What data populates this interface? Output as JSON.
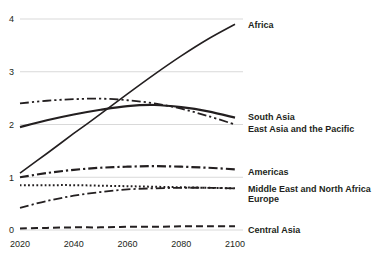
{
  "chart_data": {
    "type": "line",
    "title": "",
    "subtitle": "",
    "xlabel": "",
    "ylabel": "",
    "xlim": [
      2020,
      2100
    ],
    "ylim": [
      0,
      4
    ],
    "xticks": [
      2020,
      2040,
      2060,
      2080,
      2100
    ],
    "xtick_labels": [
      "2020",
      "2040",
      "2060",
      "2080",
      "2100"
    ],
    "yticks": [
      0,
      1,
      2,
      3,
      4
    ],
    "ytick_labels": [
      "0",
      "1",
      "2",
      "3",
      "4"
    ],
    "grid": "horizontal",
    "legend_position": "right-inline-end-of-line",
    "x": [
      2020,
      2030,
      2040,
      2050,
      2060,
      2070,
      2080,
      2090,
      2100
    ],
    "series": [
      {
        "name": "Africa",
        "label": "Africa",
        "style": "solid",
        "width": 1.6,
        "values": [
          1.08,
          1.45,
          1.83,
          2.2,
          2.58,
          2.95,
          3.3,
          3.62,
          3.9
        ],
        "label_y": 3.9
      },
      {
        "name": "South Asia",
        "label": "South Asia",
        "style": "solid",
        "width": 2.2,
        "values": [
          1.95,
          2.08,
          2.19,
          2.28,
          2.35,
          2.37,
          2.33,
          2.25,
          2.13
        ],
        "label_y": 2.25
      },
      {
        "name": "East Asia and the Pacific",
        "label": "East Asia and the Pacific",
        "style": "dash-dot-dot",
        "width": 1.8,
        "values": [
          2.4,
          2.45,
          2.48,
          2.49,
          2.46,
          2.4,
          2.3,
          2.16,
          2.0
        ],
        "label_y": 2.0
      },
      {
        "name": "Americas",
        "label": "Americas",
        "style": "dash-dot",
        "width": 2.2,
        "values": [
          1.0,
          1.08,
          1.14,
          1.18,
          1.2,
          1.21,
          1.2,
          1.18,
          1.15
        ],
        "label_y": 1.15
      },
      {
        "name": "Middle East and North Africa",
        "label": "Middle East and North Africa",
        "style": "dotted",
        "width": 2.0,
        "values": [
          0.85,
          0.85,
          0.85,
          0.84,
          0.83,
          0.82,
          0.81,
          0.8,
          0.79
        ],
        "label_y": 0.83
      },
      {
        "name": "Europe",
        "label": "Europe",
        "style": "dash-dot",
        "width": 1.8,
        "values": [
          0.42,
          0.55,
          0.65,
          0.72,
          0.77,
          0.79,
          0.8,
          0.8,
          0.79
        ],
        "label_y": 0.66
      },
      {
        "name": "Central Asia",
        "label": "Central Asia",
        "style": "dashed",
        "width": 2.0,
        "values": [
          0.03,
          0.04,
          0.05,
          0.05,
          0.06,
          0.06,
          0.07,
          0.07,
          0.07
        ],
        "label_y": 0.07
      }
    ]
  },
  "axis": {
    "y_labels": [
      "4",
      "3",
      "2",
      "1",
      "0"
    ],
    "x_labels": [
      "2020",
      "2040",
      "2060",
      "2080",
      "2100"
    ]
  },
  "labels": {
    "africa": "Africa",
    "south_asia": "South Asia",
    "east_asia": "East Asia and the Pacific",
    "americas": "Americas",
    "mena": "Middle East and North Africa",
    "europe": "Europe",
    "central_asia": "Central Asia"
  },
  "colors": {
    "line": "#231f20",
    "grid": "#d9d9d9",
    "background": "#ffffff"
  }
}
